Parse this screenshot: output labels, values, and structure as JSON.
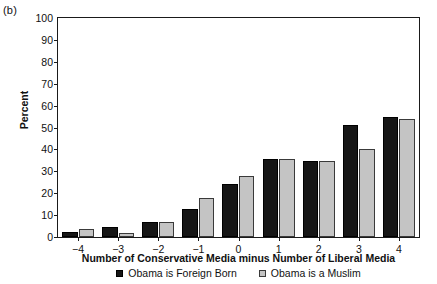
{
  "panel": {
    "label": "(b)"
  },
  "axis": {
    "ylabel": "Percent",
    "xlabel": "Number of Conservative Media minus Number of Liberal Media",
    "yticks": [
      "0",
      "10",
      "20",
      "30",
      "40",
      "50",
      "60",
      "70",
      "80",
      "90",
      "100"
    ],
    "xticks": [
      "−4",
      "−3",
      "−2",
      "−1",
      "0",
      "1",
      "2",
      "3",
      "4"
    ]
  },
  "legend": {
    "items": [
      {
        "label": "Obama is Foreign Born",
        "color": "#161616",
        "swatch": "black"
      },
      {
        "label": "Obama is a Muslim",
        "color": "#c4c4c4",
        "swatch": "gray"
      }
    ]
  },
  "chart_data": {
    "type": "bar",
    "title": "(b)",
    "xlabel": "Number of Conservative Media minus Number of Liberal Media",
    "ylabel": "Percent",
    "ylim": [
      0,
      100
    ],
    "ytick_step": 10,
    "grid": false,
    "legend_position": "bottom-center",
    "categories": [
      "-4",
      "-3",
      "-2",
      "-1",
      "0",
      "1",
      "2",
      "3",
      "4"
    ],
    "series": [
      {
        "name": "Obama is Foreign Born",
        "color": "#161616",
        "values": [
          2.5,
          4.5,
          7,
          13,
          24,
          35.5,
          34.5,
          51,
          55
        ]
      },
      {
        "name": "Obama is a Muslim",
        "color": "#c4c4c4",
        "values": [
          3.5,
          1.8,
          7,
          18,
          28,
          35.5,
          34.5,
          40,
          54
        ]
      }
    ]
  }
}
